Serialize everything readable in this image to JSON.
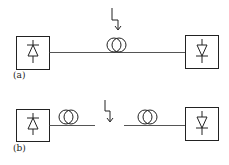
{
  "diagram": {
    "type": "optical-link-schematic",
    "panels": [
      {
        "id": "a",
        "label": "(a)",
        "transmitter": "laser-diode",
        "receiver": "photodiode",
        "fiber": "single continuous fiber with one coil",
        "disturbance": "lightning arrow acting on fiber coil"
      },
      {
        "id": "b",
        "label": "(b)",
        "transmitter": "laser-diode",
        "receiver": "photodiode",
        "fiber": "broken fiber with two coils",
        "disturbance": "lightning arrow acting on fiber gap"
      }
    ],
    "colors": {
      "stroke": "#222222",
      "line": "#555555",
      "background": "#ffffff"
    }
  }
}
